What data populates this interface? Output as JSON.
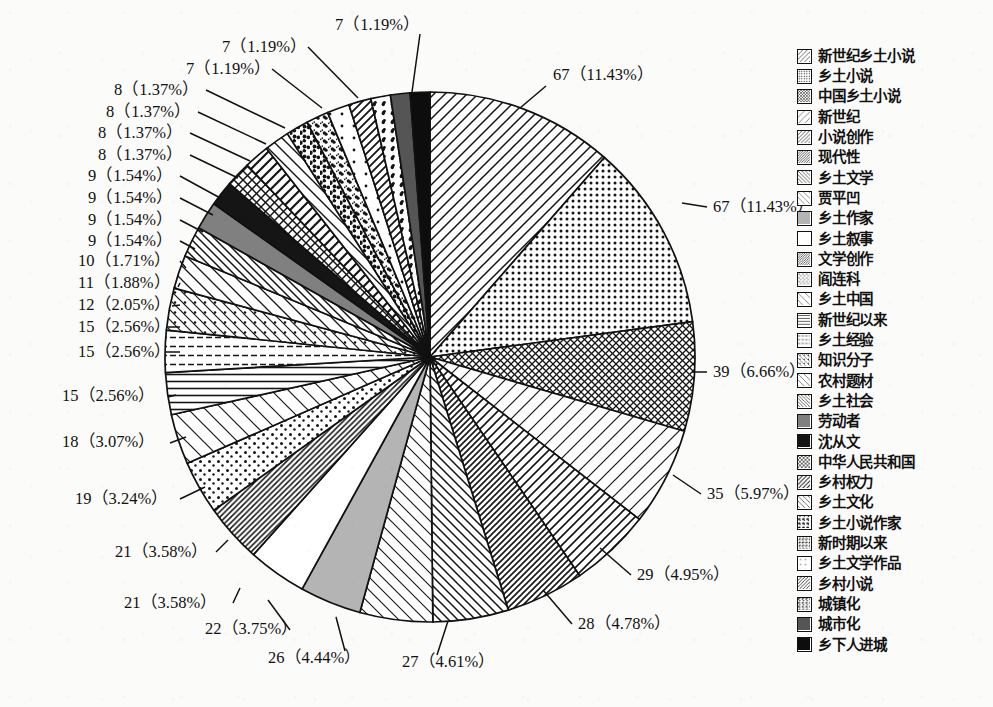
{
  "chart_data": {
    "type": "pie",
    "title": "",
    "start_angle_deg": 0,
    "direction": "clockwise",
    "total": 586,
    "label_format": "count (percent%)",
    "legend": {
      "position": "right",
      "entries": 30
    },
    "categories": [
      "新世纪乡土小说",
      "乡土小说",
      "中国乡土小说",
      "新世纪",
      "小说创作",
      "现代性",
      "乡土文学",
      "贾平凹",
      "乡土作家",
      "乡土叙事",
      "文学创作",
      "阎连科",
      "乡土中国",
      "新世纪以来",
      "乡土经验",
      "知识分子",
      "农村题材",
      "乡土社会",
      "劳动者",
      "沈从文",
      "中华人民共和国",
      "乡村权力",
      "乡土文化",
      "乡土小说作家",
      "新时期以来",
      "乡土文学作品",
      "乡村小说",
      "城镇化",
      "城市化",
      "乡下人进城"
    ],
    "values": [
      67,
      67,
      39,
      35,
      29,
      28,
      27,
      26,
      22,
      21,
      21,
      19,
      18,
      15,
      15,
      15,
      12,
      11,
      10,
      9,
      9,
      9,
      9,
      8,
      8,
      8,
      8,
      7,
      7,
      7
    ],
    "percents": [
      "11.43",
      "11.43",
      "6.66",
      "5.97",
      "4.95",
      "4.78",
      "4.61",
      "4.44",
      "3.75",
      "3.58",
      "3.58",
      "3.24",
      "3.07",
      "2.56",
      "2.56",
      "2.56",
      "2.05",
      "1.88",
      "1.71",
      "1.54",
      "1.54",
      "1.54",
      "1.54",
      "1.37",
      "1.37",
      "1.37",
      "1.37",
      "1.19",
      "1.19",
      "1.19"
    ],
    "data_labels": [
      "67（11.43%）",
      "67（11.43%）",
      "39（6.66%）",
      "35（5.97%）",
      "29（4.95%）",
      "28（4.78%）",
      "27（4.61%）",
      "26（4.44%）",
      "22（3.75%）",
      "21（3.58%）",
      "21（3.58%）",
      "19（3.24%）",
      "18（3.07%）",
      "15（2.56%）",
      "15（2.56%）",
      "15（2.56%）",
      "12（2.05%）",
      "11（1.88%）",
      "10（1.71%）",
      "9（1.54%）",
      "9（1.54%）",
      "9（1.54%）",
      "9（1.54%）",
      "8（1.37%）",
      "8（1.37%）",
      "8（1.37%）",
      "8（1.37%）",
      "7（1.19%）",
      "7（1.19%）",
      "7（1.19%）"
    ],
    "patterns": [
      "diag-up-wide",
      "dots-fine",
      "crosshatch-dense",
      "diag-up-sparse",
      "diag-up-medium",
      "diag-up-dense",
      "diag-down-medium",
      "diag-up-thin",
      "solid-gray",
      "blank-white",
      "diag-up-dense2",
      "dots-medium",
      "diag-up-sparse2",
      "horiz-lines",
      "horiz-dash",
      "diag-down-dots",
      "diag-down-sparse",
      "diag-down-hatch",
      "solid-gray-dark",
      "solid-black",
      "crosshatch-x",
      "diag-up-block",
      "diag-down-line",
      "speckle-coarse",
      "speckle-fine",
      "dots-sparse",
      "diag-up-half",
      "speckle-dot",
      "solid-gray-mid",
      "solid-black2"
    ],
    "colors": {
      "stroke": "#111111",
      "fill_default": "#ffffff",
      "gray_light": "#b4b4b4",
      "gray_mid": "#808080",
      "gray_dark": "#555555",
      "black": "#151515",
      "background": "#fbfbf9"
    }
  },
  "legend": {
    "items": [
      {
        "label": "新世纪乡土小说",
        "pattern": "diag-up-wide"
      },
      {
        "label": "乡土小说",
        "pattern": "dots-fine"
      },
      {
        "label": "中国乡土小说",
        "pattern": "crosshatch-dense"
      },
      {
        "label": "新世纪",
        "pattern": "diag-up-sparse"
      },
      {
        "label": "小说创作",
        "pattern": "diag-up-medium"
      },
      {
        "label": "现代性",
        "pattern": "diag-up-dense"
      },
      {
        "label": "乡土文学",
        "pattern": "diag-down-medium"
      },
      {
        "label": "贾平凹",
        "pattern": "diag-up-thin"
      },
      {
        "label": "乡土作家",
        "pattern": "solid-gray"
      },
      {
        "label": "乡土叙事",
        "pattern": "blank-white"
      },
      {
        "label": "文学创作",
        "pattern": "diag-up-dense2"
      },
      {
        "label": "阎连科",
        "pattern": "dots-medium"
      },
      {
        "label": "乡土中国",
        "pattern": "diag-up-sparse2"
      },
      {
        "label": "新世纪以来",
        "pattern": "horiz-lines"
      },
      {
        "label": "乡土经验",
        "pattern": "horiz-dash"
      },
      {
        "label": "知识分子",
        "pattern": "diag-down-dots"
      },
      {
        "label": "农村题材",
        "pattern": "diag-down-sparse"
      },
      {
        "label": "乡土社会",
        "pattern": "diag-down-hatch"
      },
      {
        "label": "劳动者",
        "pattern": "solid-gray-dark"
      },
      {
        "label": "沈从文",
        "pattern": "solid-black"
      },
      {
        "label": "中华人民共和国",
        "pattern": "crosshatch-x"
      },
      {
        "label": "乡村权力",
        "pattern": "diag-up-block"
      },
      {
        "label": "乡土文化",
        "pattern": "diag-down-line"
      },
      {
        "label": "乡土小说作家",
        "pattern": "speckle-coarse"
      },
      {
        "label": "新时期以来",
        "pattern": "speckle-fine"
      },
      {
        "label": "乡土文学作品",
        "pattern": "dots-sparse"
      },
      {
        "label": "乡村小说",
        "pattern": "diag-up-half"
      },
      {
        "label": "城镇化",
        "pattern": "speckle-dot"
      },
      {
        "label": "城市化",
        "pattern": "solid-gray-mid"
      },
      {
        "label": "乡下人进城",
        "pattern": "solid-black2"
      }
    ]
  },
  "geometry": {
    "cx": 430,
    "cy": 357,
    "r": 265
  },
  "annotations": [
    {
      "text": "67（11.43%）",
      "x": 553,
      "y": 80,
      "anchor": "start",
      "lx1": 546,
      "ly1": 86,
      "lx2": 520,
      "ly2": 108
    },
    {
      "text": "67（11.43%）",
      "x": 713,
      "y": 212,
      "anchor": "start",
      "lx1": 707,
      "ly1": 207,
      "lx2": 682,
      "ly2": 203
    },
    {
      "text": "39（6.66%）",
      "x": 713,
      "y": 377,
      "anchor": "start",
      "lx1": 707,
      "ly1": 372,
      "lx2": 692,
      "ly2": 372
    },
    {
      "text": "35（5.97%）",
      "x": 707,
      "y": 499,
      "anchor": "start",
      "lx1": 701,
      "ly1": 494,
      "lx2": 673,
      "ly2": 475
    },
    {
      "text": "29（4.95%）",
      "x": 637,
      "y": 580,
      "anchor": "start",
      "lx1": 631,
      "ly1": 575,
      "lx2": 600,
      "ly2": 548
    },
    {
      "text": "28（4.78%）",
      "x": 578,
      "y": 629,
      "anchor": "start",
      "lx1": 572,
      "ly1": 624,
      "lx2": 543,
      "ly2": 590
    },
    {
      "text": "27（4.61%）",
      "x": 402,
      "y": 667,
      "anchor": "start",
      "lx1": 437,
      "ly1": 655,
      "lx2": 448,
      "ly2": 621
    },
    {
      "text": "26（4.44%）",
      "x": 268,
      "y": 663,
      "anchor": "start",
      "lx1": 345,
      "ly1": 651,
      "lx2": 336,
      "ly2": 617
    },
    {
      "text": "22（3.75%）",
      "x": 205,
      "y": 634,
      "anchor": "start",
      "lx1": 290,
      "ly1": 630,
      "lx2": 268,
      "ly2": 600
    },
    {
      "text": "21（3.58%）",
      "x": 124,
      "y": 608,
      "anchor": "start",
      "lx1": 233,
      "ly1": 603,
      "lx2": 240,
      "ly2": 588
    },
    {
      "text": "21（3.58%）",
      "x": 115,
      "y": 557,
      "anchor": "start",
      "lx1": 216,
      "ly1": 552,
      "lx2": 228,
      "ly2": 540
    },
    {
      "text": "19（3.24%）",
      "x": 75,
      "y": 504,
      "anchor": "start",
      "lx1": 180,
      "ly1": 499,
      "lx2": 205,
      "ly2": 487
    },
    {
      "text": "18（3.07%）",
      "x": 62,
      "y": 447,
      "anchor": "start",
      "lx1": 170,
      "ly1": 443,
      "lx2": 186,
      "ly2": 437
    },
    {
      "text": "15（2.56%）",
      "x": 62,
      "y": 401,
      "anchor": "start",
      "lx1": 168,
      "ly1": 397,
      "lx2": 176,
      "ly2": 395
    },
    {
      "text": "15（2.56%）",
      "x": 78,
      "y": 357,
      "anchor": "start",
      "lx1": 180,
      "ly1": 352,
      "lx2": 166,
      "ly2": 352
    },
    {
      "text": "15（2.56%）",
      "x": 78,
      "y": 332,
      "anchor": "start",
      "lx1": 180,
      "ly1": 327,
      "lx2": 168,
      "ly2": 327
    },
    {
      "text": "12（2.05%）",
      "x": 78,
      "y": 310,
      "anchor": "start",
      "lx1": 180,
      "ly1": 305,
      "lx2": 172,
      "ly2": 306
    },
    {
      "text": "11（1.88%）",
      "x": 78,
      "y": 288,
      "anchor": "start",
      "lx1": 180,
      "ly1": 283,
      "lx2": 178,
      "ly2": 287
    },
    {
      "text": "10（1.71%）",
      "x": 78,
      "y": 266,
      "anchor": "start",
      "lx1": 180,
      "ly1": 261,
      "lx2": 186,
      "ly2": 268
    },
    {
      "text": "9（1.54%）",
      "x": 88,
      "y": 246,
      "anchor": "start",
      "lx1": 180,
      "ly1": 241,
      "lx2": 195,
      "ly2": 249
    },
    {
      "text": "9（1.54%）",
      "x": 88,
      "y": 225,
      "anchor": "start",
      "lx1": 180,
      "ly1": 220,
      "lx2": 203,
      "ly2": 232
    },
    {
      "text": "9（1.54%）",
      "x": 88,
      "y": 203,
      "anchor": "start",
      "lx1": 180,
      "ly1": 198,
      "lx2": 213,
      "ly2": 215
    },
    {
      "text": "9（1.54%）",
      "x": 88,
      "y": 181,
      "anchor": "start",
      "lx1": 180,
      "ly1": 176,
      "lx2": 222,
      "ly2": 199
    },
    {
      "text": "8（1.37%）",
      "x": 98,
      "y": 160,
      "anchor": "start",
      "lx1": 190,
      "ly1": 155,
      "lx2": 238,
      "ly2": 178
    },
    {
      "text": "8（1.37%）",
      "x": 98,
      "y": 138,
      "anchor": "start",
      "lx1": 190,
      "ly1": 133,
      "lx2": 250,
      "ly2": 161
    },
    {
      "text": "8（1.37%）",
      "x": 106,
      "y": 117,
      "anchor": "start",
      "lx1": 198,
      "ly1": 112,
      "lx2": 266,
      "ly2": 144
    },
    {
      "text": "8（1.37%）",
      "x": 114,
      "y": 95,
      "anchor": "start",
      "lx1": 206,
      "ly1": 90,
      "lx2": 285,
      "ly2": 128
    },
    {
      "text": "7（1.19%）",
      "x": 186,
      "y": 74,
      "anchor": "start",
      "lx1": 272,
      "ly1": 69,
      "lx2": 322,
      "ly2": 108
    },
    {
      "text": "7（1.19%）",
      "x": 222,
      "y": 52,
      "anchor": "start",
      "lx1": 308,
      "ly1": 47,
      "lx2": 358,
      "ly2": 98
    },
    {
      "text": "7（1.19%）",
      "x": 335,
      "y": 30,
      "anchor": "start",
      "lx1": 420,
      "ly1": 34,
      "lx2": 412,
      "ly2": 92
    }
  ]
}
